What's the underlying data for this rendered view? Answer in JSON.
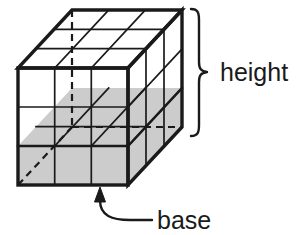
{
  "figure": {
    "labels": {
      "height": "height",
      "base": "base"
    },
    "colors": {
      "stroke": "#1a1a1a",
      "base_fill": "#cccccc",
      "face_fill": "#ffffff",
      "text": "#1a1a1a",
      "background": "#ffffff"
    },
    "geometry": {
      "type": "oblique-projection-box",
      "divisions_width": 3,
      "divisions_height": 3,
      "divisions_depth": 3,
      "front_face": {
        "left": 18,
        "right": 128,
        "top": 68,
        "bottom": 185
      },
      "depth_offset": {
        "dx": 54,
        "dy": -58
      },
      "shaded_layer": "bottom",
      "hidden_edges_style": "dashed"
    },
    "annotations": {
      "height_brace": {
        "x": 191,
        "y_top": 9,
        "y_bottom": 136,
        "side": "right"
      },
      "base_arrow": {
        "tip_x": 100,
        "tip_y": 188,
        "direction": "up"
      }
    }
  }
}
